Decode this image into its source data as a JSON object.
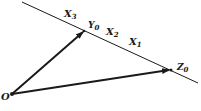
{
  "diagram": {
    "colors": {
      "stroke": "#1a1a1a",
      "background": "#ffffff"
    },
    "origin": {
      "label": "O",
      "x": 12,
      "y": 94
    },
    "line": {
      "x1": 22,
      "y1": 2,
      "x2": 198,
      "y2": 83
    },
    "points_on_line": [
      {
        "label": "X",
        "sub": "3"
      },
      {
        "label": "Y",
        "sub": "0"
      },
      {
        "label": "X",
        "sub": "2"
      },
      {
        "label": "X",
        "sub": "1"
      },
      {
        "label": "Z",
        "sub": "0"
      }
    ],
    "vectors": [
      {
        "from": "O",
        "to": "Y0"
      },
      {
        "from": "O",
        "to": "Z0"
      }
    ]
  }
}
